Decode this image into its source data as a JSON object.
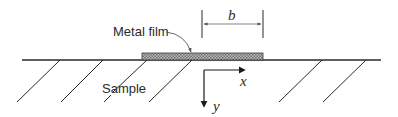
{
  "diagram": {
    "labels": {
      "metal_film": "Metal film",
      "sample": "Sample",
      "dimension": "b",
      "x_axis": "x",
      "y_axis": "y"
    },
    "colors": {
      "line": "#2a2a2a",
      "film_fill": "#9a9a9a",
      "background": "#ffffff"
    }
  }
}
